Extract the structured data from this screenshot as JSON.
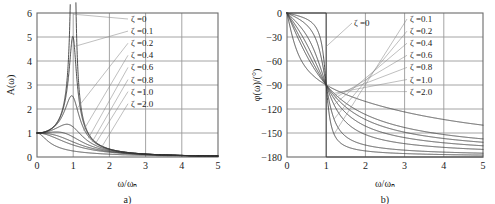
{
  "figure": {
    "panels": [
      {
        "caption": "a)",
        "xlabel": "ω/ωₙ",
        "ylabel": "A(ω)",
        "legend_title": "",
        "legend": [
          "ζ =0",
          "ζ =0.1",
          "ζ =0.2",
          "ζ =0.4",
          "ζ =0.6",
          "ζ =0.8",
          "ζ =1.0",
          "ζ =2.0"
        ]
      },
      {
        "caption": "b)",
        "xlabel": "ω/ωₙ",
        "ylabel": "φ(ω)/(°)",
        "legend_zero": "ζ =0",
        "legend": [
          "ζ =0.1",
          "ζ =0.2",
          "ζ =0.4",
          "ζ =0.6",
          "ζ =0.8",
          "ζ =1.0",
          "ζ =2.0"
        ]
      }
    ],
    "colors": {
      "curve": "#3a3a3a",
      "grid": "#9a9a9a",
      "frame": "#6b6b6b",
      "background": "#ffffff"
    }
  },
  "chart_data": [
    {
      "type": "line",
      "title": "",
      "panel": "a",
      "xlabel": "ω/ωₙ",
      "ylabel": "A(ω)",
      "xlim": [
        0,
        5
      ],
      "ylim": [
        0,
        6
      ],
      "xticks": [
        0,
        1,
        2,
        3,
        4,
        5
      ],
      "yticks": [
        0,
        1,
        2,
        3,
        4,
        5,
        6
      ],
      "grid": true,
      "legend_position": "upper-center-right",
      "formula": "A = 1 / sqrt((1-r^2)^2 + (2*zeta*r)^2)",
      "series": [
        {
          "name": "ζ =0",
          "zeta": 0.0,
          "peak_value": 6.0,
          "peak_x": 1.0
        },
        {
          "name": "ζ =0.1",
          "zeta": 0.1,
          "peak_value": 5.03,
          "peak_x": 0.99
        },
        {
          "name": "ζ =0.2",
          "zeta": 0.2,
          "peak_value": 2.55,
          "peak_x": 0.96
        },
        {
          "name": "ζ =0.4",
          "zeta": 0.4,
          "peak_value": 1.36,
          "peak_x": 0.82
        },
        {
          "name": "ζ =0.6",
          "zeta": 0.6,
          "peak_value": 1.04,
          "peak_x": 0.53
        },
        {
          "name": "ζ =0.8",
          "zeta": 0.8,
          "peak_value": 1.0,
          "peak_x": 0.0
        },
        {
          "name": "ζ =1.0",
          "zeta": 1.0,
          "peak_value": 1.0,
          "peak_x": 0.0
        },
        {
          "name": "ζ =2.0",
          "zeta": 2.0,
          "peak_value": 1.0,
          "peak_x": 0.0
        }
      ]
    },
    {
      "type": "line",
      "title": "",
      "panel": "b",
      "xlabel": "ω/ωₙ",
      "ylabel": "φ(ω)/(°)",
      "xlim": [
        0,
        5
      ],
      "ylim": [
        -180,
        0
      ],
      "xticks": [
        0,
        1,
        2,
        3,
        4,
        5
      ],
      "yticks": [
        0,
        -30,
        -60,
        -90,
        -120,
        -150,
        -180
      ],
      "grid": true,
      "legend_position": "upper-right",
      "formula": "phi = -atan2(2*zeta*r, 1-r^2)",
      "series": [
        {
          "name": "ζ =0",
          "zeta": 0.0,
          "phase_at_1": -90,
          "phase_at_5": -180
        },
        {
          "name": "ζ =0.1",
          "zeta": 0.1,
          "phase_at_1": -90,
          "phase_at_5": -177.6
        },
        {
          "name": "ζ =0.2",
          "zeta": 0.2,
          "phase_at_1": -90,
          "phase_at_5": -175.2
        },
        {
          "name": "ζ =0.4",
          "zeta": 0.4,
          "phase_at_1": -90,
          "phase_at_5": -170.5
        },
        {
          "name": "ζ =0.6",
          "zeta": 0.6,
          "phase_at_1": -90,
          "phase_at_5": -165.8
        },
        {
          "name": "ζ =0.8",
          "zeta": 0.8,
          "phase_at_1": -90,
          "phase_at_5": -161.3
        },
        {
          "name": "ζ =1.0",
          "zeta": 1.0,
          "phase_at_1": -90,
          "phase_at_5": -157.0
        },
        {
          "name": "ζ =2.0",
          "zeta": 2.0,
          "phase_at_1": -90,
          "phase_at_5": -140.2
        }
      ]
    }
  ]
}
